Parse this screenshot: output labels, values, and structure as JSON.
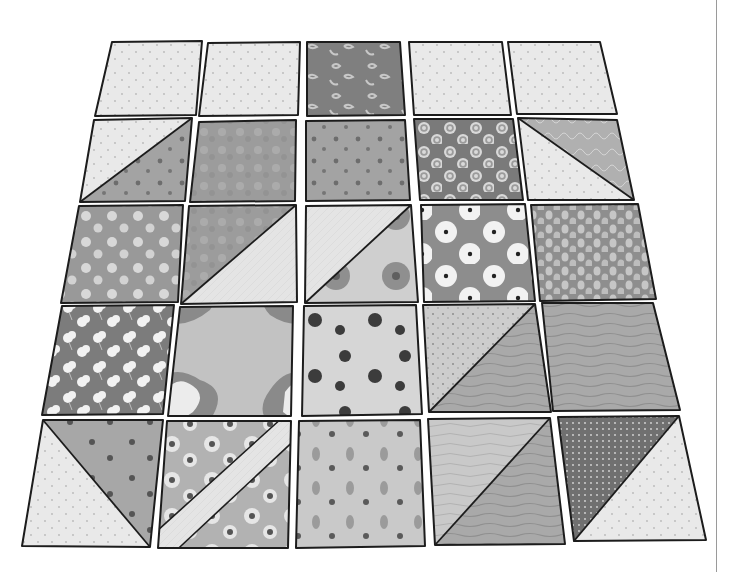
{
  "illustration": {
    "subject": "quilt-blocks-in-perspective",
    "rows": 5,
    "cols": 5,
    "colors": {
      "outline": "#1c1c1c",
      "light": "#e9e9e9",
      "dot": "#b8b8b8",
      "mid": "#a8a8a8",
      "midlight": "#c9c9c9",
      "dark": "#7f7f7f",
      "darker": "#6a6a6a",
      "flower": "#f2f2f2",
      "blob": "#3c3c3c",
      "divider": "#9a9a9a"
    },
    "tiles": [
      {
        "id": "r1c1",
        "type": "solid",
        "fill": "dots-light",
        "pts": [
          [
            112,
            42
          ],
          [
            202,
            41
          ],
          [
            196,
            115
          ],
          [
            95,
            116
          ]
        ]
      },
      {
        "id": "r1c2",
        "type": "solid",
        "fill": "dots-light",
        "pts": [
          [
            208,
            43
          ],
          [
            300,
            42
          ],
          [
            298,
            115
          ],
          [
            199,
            116
          ]
        ]
      },
      {
        "id": "r1c3",
        "type": "solid",
        "fill": "floral-dark",
        "pts": [
          [
            307,
            42
          ],
          [
            400,
            42
          ],
          [
            405,
            115
          ],
          [
            307,
            116
          ]
        ]
      },
      {
        "id": "r1c4",
        "type": "solid",
        "fill": "dots-light",
        "pts": [
          [
            409,
            42
          ],
          [
            502,
            42
          ],
          [
            511,
            115
          ],
          [
            414,
            115
          ]
        ]
      },
      {
        "id": "r1c5",
        "type": "solid",
        "fill": "dots-light",
        "pts": [
          [
            508,
            42
          ],
          [
            600,
            42
          ],
          [
            617,
            114
          ],
          [
            517,
            114
          ]
        ]
      },
      {
        "id": "r2c1",
        "type": "hst",
        "diag": "bl-tr",
        "a": "dots-light",
        "b": "sprig-mid",
        "pts": [
          [
            94,
            120
          ],
          [
            192,
            118
          ],
          [
            185,
            201
          ],
          [
            80,
            202
          ]
        ]
      },
      {
        "id": "r2c2",
        "type": "solid",
        "fill": "mottle-mid",
        "pts": [
          [
            199,
            122
          ],
          [
            296,
            120
          ],
          [
            295,
            201
          ],
          [
            190,
            202
          ]
        ]
      },
      {
        "id": "r2c3",
        "type": "solid",
        "fill": "sprig-mid",
        "pts": [
          [
            306,
            121
          ],
          [
            405,
            120
          ],
          [
            410,
            200
          ],
          [
            306,
            201
          ]
        ]
      },
      {
        "id": "r2c4",
        "type": "solid",
        "fill": "rings-dark",
        "pts": [
          [
            414,
            119
          ],
          [
            513,
            119
          ],
          [
            523,
            200
          ],
          [
            420,
            200
          ]
        ]
      },
      {
        "id": "r2c5",
        "type": "hst",
        "diag": "tl-br",
        "a": "dots-light",
        "b": "lace-mid",
        "pts": [
          [
            518,
            118
          ],
          [
            617,
            120
          ],
          [
            634,
            200
          ],
          [
            528,
            200
          ]
        ]
      },
      {
        "id": "r3c1",
        "type": "solid",
        "fill": "daisy-mid",
        "pts": [
          [
            79,
            206
          ],
          [
            183,
            205
          ],
          [
            178,
            302
          ],
          [
            61,
            303
          ]
        ]
      },
      {
        "id": "r3c2",
        "type": "hst",
        "diag": "bl-tr",
        "a": "mottle-mid",
        "b": "plain-light",
        "pts": [
          [
            189,
            206
          ],
          [
            296,
            205
          ],
          [
            297,
            302
          ],
          [
            181,
            304
          ]
        ]
      },
      {
        "id": "r3c3",
        "type": "hst",
        "diag": "bl-tr",
        "a": "plain-light",
        "b": "rose-light",
        "pts": [
          [
            306,
            206
          ],
          [
            411,
            205
          ],
          [
            418,
            302
          ],
          [
            305,
            303
          ]
        ]
      },
      {
        "id": "r3c4",
        "type": "solid",
        "fill": "bigflower-mid",
        "pts": [
          [
            421,
            205
          ],
          [
            525,
            204
          ],
          [
            535,
            301
          ],
          [
            424,
            302
          ]
        ]
      },
      {
        "id": "r3c5",
        "type": "solid",
        "fill": "leaf-mid",
        "pts": [
          [
            531,
            205
          ],
          [
            638,
            204
          ],
          [
            656,
            299
          ],
          [
            540,
            301
          ]
        ]
      },
      {
        "id": "r4c1",
        "type": "solid",
        "fill": "clover-dark",
        "pts": [
          [
            62,
            306
          ],
          [
            174,
            305
          ],
          [
            163,
            414
          ],
          [
            42,
            415
          ]
        ]
      },
      {
        "id": "r4c2",
        "type": "solid",
        "fill": "bloom-light",
        "pts": [
          [
            180,
            307
          ],
          [
            293,
            306
          ],
          [
            291,
            416
          ],
          [
            168,
            416
          ]
        ]
      },
      {
        "id": "r4c3",
        "type": "solid",
        "fill": "blob-light",
        "pts": [
          [
            304,
            306
          ],
          [
            416,
            305
          ],
          [
            422,
            414
          ],
          [
            302,
            416
          ]
        ]
      },
      {
        "id": "r4c4",
        "type": "hst",
        "diag": "bl-tr",
        "a": "speckle-light",
        "b": "wood-mid",
        "pts": [
          [
            423,
            305
          ],
          [
            535,
            304
          ],
          [
            551,
            412
          ],
          [
            429,
            412
          ]
        ]
      },
      {
        "id": "r4c5",
        "type": "solid",
        "fill": "wood-mid",
        "pts": [
          [
            542,
            303
          ],
          [
            653,
            303
          ],
          [
            680,
            410
          ],
          [
            553,
            411
          ]
        ]
      },
      {
        "id": "r5c1",
        "type": "hst",
        "diag": "tl-br",
        "a": "dots-light",
        "b": "spot-mid",
        "pts": [
          [
            43,
            420
          ],
          [
            163,
            420
          ],
          [
            150,
            547
          ],
          [
            22,
            546
          ]
        ]
      },
      {
        "id": "r5c2",
        "type": "strip",
        "a": "daisy-light",
        "b": "plain-light",
        "pts": [
          [
            167,
            421
          ],
          [
            291,
            421
          ],
          [
            288,
            548
          ],
          [
            158,
            548
          ]
        ]
      },
      {
        "id": "r5c3",
        "type": "solid",
        "fill": "petal-light",
        "pts": [
          [
            299,
            421
          ],
          [
            420,
            420
          ],
          [
            425,
            546
          ],
          [
            296,
            548
          ]
        ]
      },
      {
        "id": "r5c4",
        "type": "hst",
        "diag": "bl-tr",
        "a": "wood-light",
        "b": "wood-mid",
        "pts": [
          [
            428,
            419
          ],
          [
            550,
            418
          ],
          [
            565,
            544
          ],
          [
            435,
            545
          ]
        ]
      },
      {
        "id": "r5c5",
        "type": "hst",
        "diag": "bl-tr",
        "a": "stripe-dark",
        "b": "dots-light",
        "pts": [
          [
            558,
            417
          ],
          [
            679,
            416
          ],
          [
            706,
            540
          ],
          [
            574,
            541
          ]
        ]
      }
    ]
  }
}
